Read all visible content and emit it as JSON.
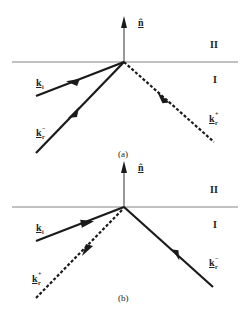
{
  "figure": {
    "panels": [
      {
        "id": "a",
        "caption": "(a)",
        "normal_label": "n̂",
        "region_upper": "II",
        "region_lower": "I",
        "vectors": [
          {
            "name": "k_i",
            "base": "k",
            "sub": "i",
            "sup": "",
            "style": "solid",
            "direction": "toward-origin"
          },
          {
            "name": "k_r_minus",
            "base": "k",
            "sub": "r",
            "sup": "−",
            "style": "solid",
            "direction": "toward-origin"
          },
          {
            "name": "k_r_plus",
            "base": "k",
            "sub": "r",
            "sup": "+",
            "style": "dashed",
            "direction": "away-from-origin"
          }
        ]
      },
      {
        "id": "b",
        "caption": "(b)",
        "normal_label": "n̂",
        "region_upper": "II",
        "region_lower": "I",
        "vectors": [
          {
            "name": "k_i",
            "base": "k",
            "sub": "i",
            "sup": "",
            "style": "solid",
            "direction": "away-from-origin"
          },
          {
            "name": "k_r_plus",
            "base": "k",
            "sub": "r",
            "sup": "+",
            "style": "dashed",
            "direction": "away-from-origin"
          },
          {
            "name": "k_r_minus",
            "base": "k",
            "sub": "r",
            "sup": "−",
            "style": "solid",
            "direction": "toward-origin"
          }
        ]
      }
    ],
    "colors": {
      "line": "#1a1a1a",
      "interface": "#555555",
      "background": "#ffffff"
    }
  }
}
